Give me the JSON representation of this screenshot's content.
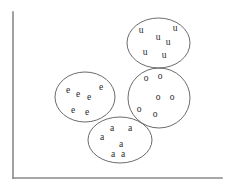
{
  "figure": {
    "width": 228,
    "height": 187,
    "background_color": "#ffffff"
  },
  "axes": {
    "axis_color": "#8a8a8a",
    "y_axis_label": "",
    "x_axis_label": "",
    "origin_x": 13,
    "origin_y": 178,
    "y_axis_top": 12,
    "x_axis_right": 222,
    "ticks": [],
    "grid": false
  },
  "style": {
    "outline_color": "#5a5a5a",
    "letter_color": "#2b2b2b",
    "letter_font_size": 9.5
  },
  "chart_data": {
    "type": "scatter",
    "title": "",
    "xlabel": "",
    "ylabel": "",
    "grid": false,
    "legend_position": "none",
    "xlim": [
      13,
      222
    ],
    "ylim": [
      12,
      178
    ],
    "clusters": [
      {
        "name": "u-cluster",
        "label": "u",
        "count": 5,
        "ellipse": {
          "cx": 158.5,
          "cy": 43.0,
          "rx": 31.5,
          "ry": 25.0,
          "rotation": 0
        },
        "points": [
          {
            "label": "u",
            "x": 141,
            "y": 33
          },
          {
            "label": "u",
            "x": 158,
            "y": 40
          },
          {
            "label": "u",
            "x": 168,
            "y": 45
          },
          {
            "label": "u",
            "x": 175,
            "y": 31
          },
          {
            "label": "u",
            "x": 145,
            "y": 55
          },
          {
            "label": "u",
            "x": 164,
            "y": 58
          }
        ]
      },
      {
        "name": "o-cluster",
        "label": "o",
        "count": 6,
        "ellipse": {
          "cx": 159.0,
          "cy": 98.0,
          "rx": 31.0,
          "ry": 30.0,
          "rotation": 0
        },
        "points": [
          {
            "label": "o",
            "x": 146,
            "y": 81
          },
          {
            "label": "o",
            "x": 160,
            "y": 79
          },
          {
            "label": "o",
            "x": 158,
            "y": 100
          },
          {
            "label": "o",
            "x": 172,
            "y": 100
          },
          {
            "label": "o",
            "x": 139,
            "y": 112
          },
          {
            "label": "o",
            "x": 155,
            "y": 117
          }
        ]
      },
      {
        "name": "e-cluster",
        "label": "e",
        "count": 6,
        "ellipse": {
          "cx": 85.0,
          "cy": 97.0,
          "rx": 30.0,
          "ry": 25.0,
          "rotation": 0
        },
        "points": [
          {
            "label": "e",
            "x": 68,
            "y": 93
          },
          {
            "label": "e",
            "x": 78,
            "y": 97
          },
          {
            "label": "e",
            "x": 89,
            "y": 100
          },
          {
            "label": "e",
            "x": 101,
            "y": 90
          },
          {
            "label": "e",
            "x": 73,
            "y": 113
          },
          {
            "label": "e",
            "x": 87,
            "y": 115
          }
        ]
      },
      {
        "name": "a-cluster",
        "label": "a",
        "count": 6,
        "ellipse": {
          "cx": 120.0,
          "cy": 140.0,
          "rx": 32.0,
          "ry": 23.0,
          "rotation": 0
        },
        "points": [
          {
            "label": "a",
            "x": 112,
            "y": 131
          },
          {
            "label": "a",
            "x": 130,
            "y": 131
          },
          {
            "label": "a",
            "x": 102,
            "y": 140
          },
          {
            "label": "a",
            "x": 121,
            "y": 147
          },
          {
            "label": "a",
            "x": 113,
            "y": 157
          },
          {
            "label": "a",
            "x": 123,
            "y": 157
          }
        ]
      }
    ]
  }
}
